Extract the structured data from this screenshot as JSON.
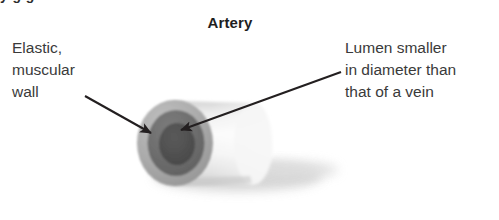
{
  "figure": {
    "title": "Artery",
    "top_cut_text": "y          g        g",
    "background_color": "#ffffff"
  },
  "labels": {
    "left": {
      "name": "elastic-muscular-wall",
      "lines": [
        "Elastic,",
        "muscular",
        "wall"
      ],
      "color": "#3a3a3a"
    },
    "right": {
      "name": "lumen-diameter-note",
      "lines": [
        "Lumen smaller",
        "in diameter than",
        "that of a vein"
      ],
      "color": "#3a3a3a"
    }
  },
  "diagram": {
    "type": "artery-cross-section-cylinder",
    "colors": {
      "outer_wall": "#b0b0b0",
      "outer_wall_dark": "#9a9a9a",
      "muscular_layer": "#6e6e6e",
      "lumen": "#4f4f4f",
      "barrel_light": "#f2f2f2",
      "barrel_mid": "#d6d6d6",
      "shadow": "#d9d9d9",
      "arrow": "#231f20"
    },
    "parts": [
      {
        "name": "outer-elastic-muscular-wall",
        "ring": "outer"
      },
      {
        "name": "muscular-layer",
        "ring": "middle"
      },
      {
        "name": "lumen",
        "ring": "inner"
      },
      {
        "name": "vessel-barrel",
        "ring": "body"
      },
      {
        "name": "drop-shadow",
        "ring": "shadow"
      }
    ],
    "arrows": [
      {
        "name": "arrow-to-wall",
        "from": [
          85,
          96
        ],
        "to": [
          151,
          133
        ]
      },
      {
        "name": "arrow-to-lumen",
        "from": [
          341,
          72
        ],
        "to": [
          181,
          130
        ]
      }
    ]
  }
}
